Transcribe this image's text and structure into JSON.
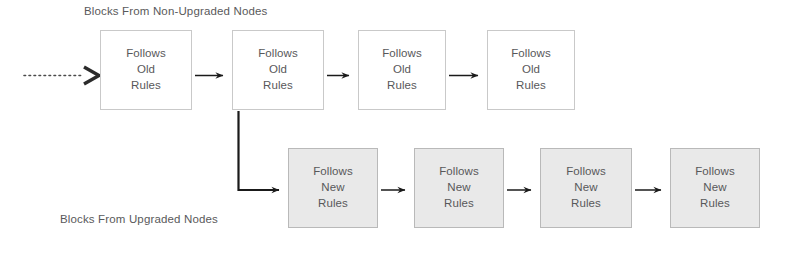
{
  "diagram": {
    "title_top": "Blocks From Non-Upgraded Nodes",
    "title_bottom": "Blocks From Upgraded Nodes",
    "colors": {
      "old_fill": "#ffffff",
      "old_border": "#c9c9c9",
      "new_fill": "#e9e9e9",
      "new_border": "#b9b9b9",
      "text": "#58585a",
      "arrow": "#1a1a1a",
      "background": "#ffffff"
    },
    "chains": {
      "old": {
        "label": "Blocks From Non-Upgraded Nodes",
        "node_line1": "Follows",
        "node_line2": "Old",
        "node_line3": "Rules",
        "nodes": [
          {
            "line1": "Follows",
            "line2": "Old",
            "line3": "Rules",
            "x": 100,
            "y": 30,
            "w": 92,
            "h": 80
          },
          {
            "line1": "Follows",
            "line2": "Old",
            "line3": "Rules",
            "x": 232,
            "y": 30,
            "w": 92,
            "h": 80
          },
          {
            "line1": "Follows",
            "line2": "Old",
            "line3": "Rules",
            "x": 358,
            "y": 30,
            "w": 88,
            "h": 80
          },
          {
            "line1": "Follows",
            "line2": "Old",
            "line3": "Rules",
            "x": 487,
            "y": 30,
            "w": 88,
            "h": 80
          }
        ]
      },
      "new": {
        "label": "Blocks From Upgraded Nodes",
        "node_line1": "Follows",
        "node_line2": "New",
        "node_line3": "Rules",
        "nodes": [
          {
            "line1": "Follows",
            "line2": "New",
            "line3": "Rules",
            "x": 288,
            "y": 148,
            "w": 90,
            "h": 80
          },
          {
            "line1": "Follows",
            "line2": "New",
            "line3": "Rules",
            "x": 414,
            "y": 148,
            "w": 90,
            "h": 80
          },
          {
            "line1": "Follows",
            "line2": "New",
            "line3": "Rules",
            "x": 540,
            "y": 148,
            "w": 92,
            "h": 80
          },
          {
            "line1": "Follows",
            "line2": "New",
            "line3": "Rules",
            "x": 670,
            "y": 148,
            "w": 90,
            "h": 80
          }
        ]
      }
    },
    "connectors": [
      {
        "name": "incoming-dotted-arrow",
        "style": "dotted",
        "from_x": 22,
        "from_y": 75,
        "to_x": 98,
        "to_y": 75
      },
      {
        "name": "old-arrow-1-2",
        "style": "solid",
        "from_x": 194,
        "from_y": 75,
        "to_x": 230,
        "to_y": 75
      },
      {
        "name": "old-arrow-2-3",
        "style": "solid",
        "from_x": 326,
        "from_y": 75,
        "to_x": 356,
        "to_y": 75
      },
      {
        "name": "old-arrow-3-4",
        "style": "solid",
        "from_x": 448,
        "from_y": 75,
        "to_x": 485,
        "to_y": 75
      },
      {
        "name": "fork-branch-arrow",
        "style": "elbow",
        "from_x": 238,
        "from_y": 112,
        "to_x": 286,
        "to_y": 190
      },
      {
        "name": "new-arrow-1-2",
        "style": "solid",
        "from_x": 380,
        "from_y": 190,
        "to_x": 412,
        "to_y": 190
      },
      {
        "name": "new-arrow-2-3",
        "style": "solid",
        "from_x": 506,
        "from_y": 190,
        "to_x": 538,
        "to_y": 190
      },
      {
        "name": "new-arrow-3-4",
        "style": "solid",
        "from_x": 634,
        "from_y": 190,
        "to_x": 668,
        "to_y": 190
      }
    ]
  }
}
